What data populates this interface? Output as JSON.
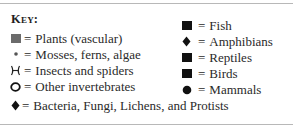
{
  "key": {
    "title": "Key:",
    "left_items": [
      {
        "icon": "square-gray-icon",
        "equals": "=",
        "label": "Plants (vascular)",
        "color": "#6b6b6b"
      },
      {
        "icon": "small-dot-icon",
        "equals": "=",
        "label": "Mosses, ferns, algae",
        "color": "#555555"
      },
      {
        "icon": "insect-icon",
        "equals": "=",
        "label": "Insects and spiders",
        "color": "#222222"
      },
      {
        "icon": "circle-outline-icon",
        "equals": "=",
        "label": "Other invertebrates",
        "color": "#111111"
      }
    ],
    "right_items": [
      {
        "icon": "square-black-icon",
        "equals": "=",
        "label": "Fish",
        "color": "#111111"
      },
      {
        "icon": "diamond-icon",
        "equals": "=",
        "label": "Amphibians",
        "color": "#111111"
      },
      {
        "icon": "square-black-icon",
        "equals": "=",
        "label": "Reptiles",
        "color": "#111111"
      },
      {
        "icon": "square-black-icon",
        "equals": "=",
        "label": "Birds",
        "color": "#111111"
      },
      {
        "icon": "filled-circle-icon",
        "equals": "=",
        "label": "Mammals",
        "color": "#111111"
      }
    ],
    "bottom_item": {
      "icon": "diamond-icon",
      "equals": "=",
      "label": "Bacteria, Fungi, Lichens, and Protists",
      "color": "#111111"
    }
  }
}
